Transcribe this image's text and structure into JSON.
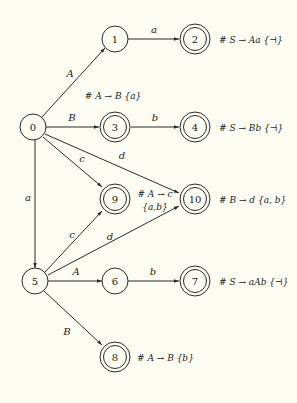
{
  "diagram": {
    "type": "state-transition-graph",
    "nodes": [
      {
        "id": "0",
        "label": "0",
        "x": 33,
        "y": 127,
        "accepting": false
      },
      {
        "id": "1",
        "label": "1",
        "x": 115,
        "y": 39,
        "accepting": false
      },
      {
        "id": "2",
        "label": "2",
        "x": 195,
        "y": 39,
        "accepting": true,
        "annotation": "# S → Aa {⊣}"
      },
      {
        "id": "3",
        "label": "3",
        "x": 115,
        "y": 127,
        "accepting": true,
        "annotation": "# A → B {a}"
      },
      {
        "id": "4",
        "label": "4",
        "x": 195,
        "y": 127,
        "accepting": true,
        "annotation": "# S → Bb {⊣}"
      },
      {
        "id": "9",
        "label": "9",
        "x": 115,
        "y": 199,
        "accepting": true,
        "annotation": "# A → c",
        "annotation2": "{a,b}"
      },
      {
        "id": "10",
        "label": "10",
        "x": 195,
        "y": 199,
        "accepting": true,
        "annotation": "# B → d {a, b}"
      },
      {
        "id": "5",
        "label": "5",
        "x": 35,
        "y": 281,
        "accepting": false
      },
      {
        "id": "6",
        "label": "6",
        "x": 115,
        "y": 281,
        "accepting": false
      },
      {
        "id": "7",
        "label": "7",
        "x": 195,
        "y": 281,
        "accepting": true,
        "annotation": "# S → aAb {⊣}"
      },
      {
        "id": "8",
        "label": "8",
        "x": 115,
        "y": 357,
        "accepting": true,
        "annotation": "# A → B {b}"
      }
    ],
    "edges": [
      {
        "from": "0",
        "to": "1",
        "label": "A"
      },
      {
        "from": "1",
        "to": "2",
        "label": "a"
      },
      {
        "from": "0",
        "to": "3",
        "label": "B"
      },
      {
        "from": "3",
        "to": "4",
        "label": "b"
      },
      {
        "from": "0",
        "to": "9",
        "label": "c"
      },
      {
        "from": "0",
        "to": "10",
        "label": "d"
      },
      {
        "from": "0",
        "to": "5",
        "label": "a"
      },
      {
        "from": "5",
        "to": "9",
        "label": "c"
      },
      {
        "from": "5",
        "to": "10",
        "label": "d"
      },
      {
        "from": "5",
        "to": "6",
        "label": "A"
      },
      {
        "from": "6",
        "to": "7",
        "label": "b"
      },
      {
        "from": "5",
        "to": "8",
        "label": "B"
      }
    ]
  },
  "labels": {
    "n0": "0",
    "n1": "1",
    "n2": "2",
    "n3": "3",
    "n4": "4",
    "n5": "5",
    "n6": "6",
    "n7": "7",
    "n8": "8",
    "n9": "9",
    "n10": "10",
    "e_0_1": "A",
    "e_1_2": "a",
    "e_0_3": "B",
    "e_3_4": "b",
    "e_0_9": "c",
    "e_0_10": "d",
    "e_0_5": "a",
    "e_5_9": "c",
    "e_5_10": "d",
    "e_5_6": "A",
    "e_6_7": "b",
    "e_5_8": "B",
    "ann2": "# S → Aa {⊣}",
    "ann3": "# A → B {a}",
    "ann4": "# S → Bb {⊣}",
    "ann9a": "# A → c",
    "ann9b": "{a,b}",
    "ann10": "# B → d {a, b}",
    "ann7": "# S → aAb {⊣}",
    "ann8": "# A → B {b}"
  },
  "colors": {
    "background": "#fdfdf4",
    "stroke": "#2a2a2a",
    "text": "#222222"
  }
}
